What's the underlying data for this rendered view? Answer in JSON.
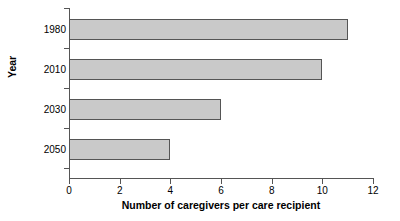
{
  "chart_data": {
    "type": "bar",
    "orientation": "horizontal",
    "title": "",
    "xlabel": "Number of caregivers per care recipient",
    "ylabel": "Year",
    "categories": [
      "1980",
      "2010",
      "2030",
      "2050"
    ],
    "values": [
      11,
      10,
      6,
      4
    ],
    "xlim": [
      0,
      12
    ],
    "xticks": [
      0,
      2,
      4,
      6,
      8,
      10,
      12
    ],
    "xtick_labels": [
      "0",
      "2",
      "4",
      "6",
      "8",
      "10",
      "12"
    ],
    "grid": false,
    "legend": null,
    "bar_fill_color": "#c9c9c9",
    "bar_border_color": "#555555",
    "axis_color": "#555555",
    "text_color": "#000000",
    "background_color": "#ffffff"
  }
}
